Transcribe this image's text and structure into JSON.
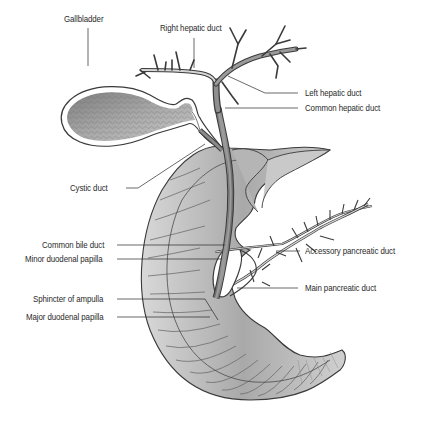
{
  "diagram": {
    "type": "anatomical illustration",
    "colors": {
      "background": "#ffffff",
      "line": "#3a3a3a",
      "fill_dark": "#8a8a8a",
      "fill_mid": "#b8b8b8",
      "fill_light": "#e2e2e2",
      "label_text": "#2a2a2a"
    },
    "labels": {
      "right_hepatic_duct": "Right hepatic duct",
      "gallbladder": "Gallbladder",
      "left_hepatic_duct": "Left hepatic duct",
      "common_hepatic_duct": "Common hepatic duct",
      "cystic_duct": "Cystic duct",
      "common_bile_duct": "Common bile duct",
      "minor_duodenal_papilla": "Minor duodenal papilla",
      "accessory_pancreatic_duct": "Accessory pancreatic duct",
      "main_pancreatic_duct": "Main pancreatic duct",
      "sphincter_of_ampulla": "Sphincter of ampulla",
      "major_duodenal_papilla": "Major duodenal papilla"
    }
  }
}
